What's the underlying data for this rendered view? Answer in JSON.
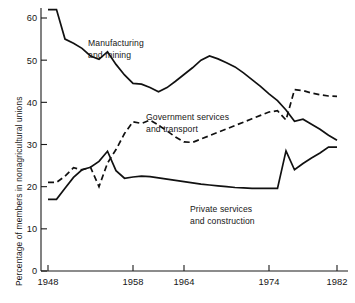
{
  "chart_data": {
    "type": "line",
    "title": "",
    "xlabel": "",
    "ylabel": "Percentage of members in nonagricultural unions",
    "xlim": [
      1947.0,
      1982.6
    ],
    "ylim": [
      0,
      63
    ],
    "grid": false,
    "legend": "inline-annotations",
    "xticks": [
      1948,
      1958,
      1964,
      1974,
      1982
    ],
    "xtick_labels": [
      "1948",
      "1958",
      "1964",
      "1974",
      "1982"
    ],
    "yticks": [
      0,
      10,
      20,
      30,
      40,
      50,
      60
    ],
    "ytick_labels": [
      "0",
      "10",
      "20",
      "30",
      "40",
      "50",
      "60"
    ],
    "series": [
      {
        "name": "Manufacturing and mining",
        "style": "solid",
        "color": "#111111",
        "annotation": [
          "Manufacturing",
          "and mining"
        ],
        "x": [
          1948,
          1949,
          1950,
          1951,
          1952,
          1953,
          1954,
          1955,
          1956,
          1957,
          1958,
          1959,
          1960,
          1961,
          1962,
          1963,
          1964,
          1965,
          1966,
          1967,
          1968,
          1969,
          1970,
          1971,
          1972,
          1973,
          1974,
          1975,
          1976,
          1977,
          1978,
          1979,
          1980,
          1981,
          1982
        ],
        "y": [
          62.0,
          62.0,
          55.0,
          54.0,
          52.8,
          51.0,
          50.2,
          52.0,
          49.0,
          46.5,
          44.5,
          44.3,
          43.5,
          42.5,
          43.5,
          45.0,
          46.6,
          48.2,
          50.0,
          51.0,
          50.3,
          49.4,
          48.4,
          47.0,
          45.4,
          43.8,
          42.0,
          40.4,
          38.2,
          35.5,
          36.0,
          34.8,
          33.6,
          32.2,
          31.0
        ]
      },
      {
        "name": "Government services and transport",
        "style": "dashed",
        "color": "#111111",
        "annotation": [
          "Government services",
          "and transport"
        ],
        "x": [
          1948,
          1949,
          1950,
          1951,
          1952,
          1953,
          1954,
          1955,
          1956,
          1957,
          1958,
          1959,
          1960,
          1961,
          1962,
          1963,
          1964,
          1965,
          1966,
          1967,
          1968,
          1969,
          1970,
          1971,
          1972,
          1973,
          1974,
          1975,
          1976,
          1977,
          1978,
          1979,
          1980,
          1981,
          1982
        ],
        "y": [
          21.0,
          21.0,
          22.5,
          24.5,
          24.0,
          24.6,
          20.0,
          25.6,
          28.8,
          32.6,
          35.4,
          35.0,
          35.8,
          34.6,
          33.2,
          31.8,
          30.6,
          30.5,
          31.3,
          32.1,
          32.9,
          33.7,
          34.5,
          35.3,
          36.1,
          36.9,
          37.7,
          38.0,
          35.8,
          43.0,
          42.8,
          42.2,
          41.8,
          41.5,
          41.4
        ]
      },
      {
        "name": "Private services and construction",
        "style": "solid",
        "color": "#111111",
        "annotation": [
          "Private services",
          "and construction"
        ],
        "x": [
          1948,
          1949,
          1950,
          1951,
          1952,
          1953,
          1954,
          1955,
          1956,
          1957,
          1958,
          1959,
          1960,
          1961,
          1962,
          1963,
          1964,
          1965,
          1966,
          1967,
          1968,
          1969,
          1970,
          1971,
          1972,
          1973,
          1974,
          1975,
          1976,
          1977,
          1978,
          1979,
          1980,
          1981,
          1982
        ],
        "y": [
          17.0,
          17.0,
          19.6,
          22.2,
          24.0,
          24.6,
          26.0,
          28.4,
          23.8,
          22.0,
          22.3,
          22.5,
          22.4,
          22.1,
          21.8,
          21.5,
          21.2,
          20.9,
          20.6,
          20.4,
          20.2,
          20.0,
          19.8,
          19.7,
          19.6,
          19.6,
          19.6,
          19.6,
          28.5,
          24.0,
          25.5,
          26.8,
          28.0,
          29.4,
          29.4
        ]
      }
    ]
  }
}
